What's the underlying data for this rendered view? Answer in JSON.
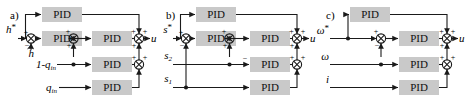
{
  "figure": {
    "type": "block-diagram",
    "block_label": "PID",
    "block_fill": "#c9c9c9",
    "line_color": "#1a1a1a",
    "background": "#ffffff",
    "panels": [
      {
        "id": "a",
        "label": "a)",
        "inputs": [
          {
            "name": "h-star",
            "text": "h",
            "sup": "*",
            "sub": ""
          },
          {
            "name": "h-hat",
            "text": "h",
            "hat": true,
            "sup": "",
            "sub": ""
          },
          {
            "name": "one-minus-q-in",
            "text": "1-q",
            "sub": "in"
          },
          {
            "name": "q-in",
            "text": "q",
            "sub": "in"
          }
        ],
        "output": {
          "name": "u",
          "text": "u"
        },
        "blocks": [
          "PID",
          "PID",
          "PID",
          "PID",
          "PID"
        ],
        "summing_junctions": 4
      },
      {
        "id": "b",
        "label": "b)",
        "inputs": [
          {
            "name": "s-star",
            "text": "s",
            "sup": "*",
            "sub": ""
          },
          {
            "name": "s2",
            "text": "s",
            "sub": "2"
          },
          {
            "name": "s1",
            "text": "s",
            "sub": "1"
          }
        ],
        "output": {
          "name": "u",
          "text": "u"
        },
        "blocks": [
          "PID",
          "PID",
          "PID",
          "PID",
          "PID"
        ],
        "summing_junctions": 4
      },
      {
        "id": "c",
        "label": "c)",
        "inputs": [
          {
            "name": "omega-star",
            "text": "ω",
            "sup": "*",
            "sub": ""
          },
          {
            "name": "omega",
            "text": "ω",
            "sub": ""
          },
          {
            "name": "current-i",
            "text": "i",
            "sub": ""
          }
        ],
        "output": {
          "name": "u",
          "text": "u"
        },
        "blocks": [
          "PID",
          "PID",
          "PID",
          "PID"
        ],
        "summing_junctions": 3
      }
    ],
    "signs": {
      "plus": "+",
      "minus": "-"
    }
  }
}
